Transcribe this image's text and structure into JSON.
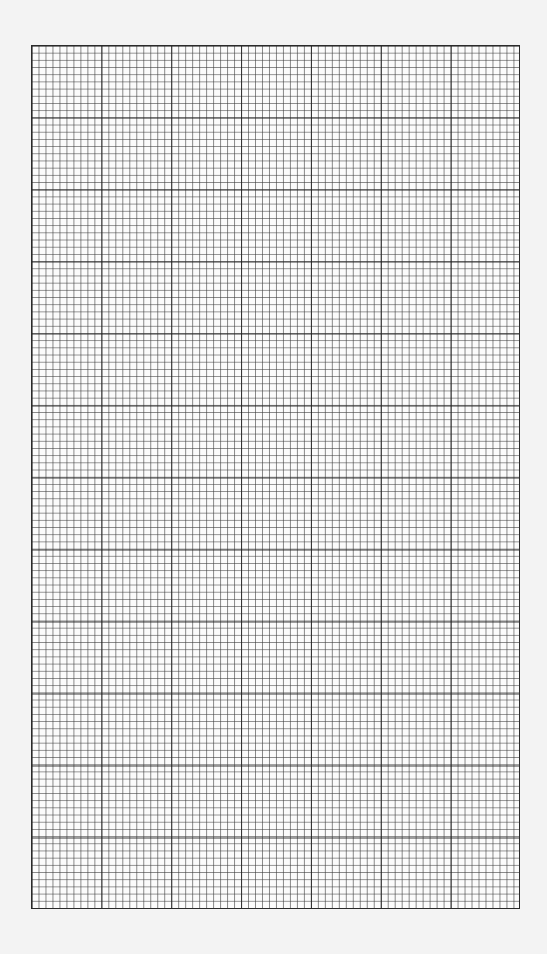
{
  "document": {
    "type": "graph-paper",
    "text": []
  },
  "grid": {
    "major_columns": 7,
    "major_rows": 12,
    "minor_per_major": 10,
    "line_color": "#2a2a2a",
    "paper_color": "#fbfbfb",
    "background_color": "#f3f3f3"
  }
}
